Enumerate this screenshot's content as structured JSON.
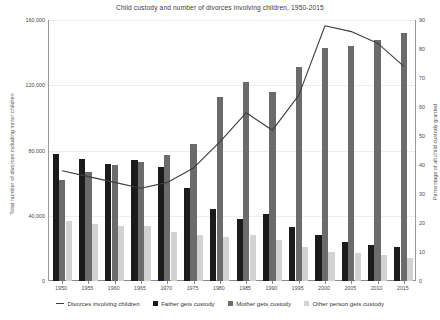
{
  "chart_data": {
    "type": "bar",
    "title": "Child custody and number of divorces involving children, 1950-2015",
    "xlabel": "",
    "ylabel": "Total number of divorces including minor children",
    "y2label": "Percentage of all child custody granted",
    "categories": [
      "1950",
      "1955",
      "1960",
      "1965",
      "1970",
      "1975",
      "1980",
      "1985",
      "1990",
      "1995",
      "2000",
      "2005",
      "2010",
      "2015"
    ],
    "ylim": [
      0,
      160000
    ],
    "yticks": [
      "0",
      "40,000",
      "80,000",
      "120,000",
      "160,000"
    ],
    "ytick_values": [
      0,
      40000,
      80000,
      120000,
      160000
    ],
    "y2lim": [
      0,
      90
    ],
    "y2ticks": [
      "0",
      "10",
      "20",
      "30",
      "40",
      "50",
      "60",
      "70",
      "80",
      "90"
    ],
    "y2tick_values": [
      0,
      10,
      20,
      30,
      40,
      50,
      60,
      70,
      80,
      90
    ],
    "grid": true,
    "legend_position": "bottom",
    "series": [
      {
        "name": "Father gets custody",
        "type": "bar",
        "axis": "left",
        "color": "#1b1b1b",
        "values": [
          78000,
          75000,
          72000,
          74000,
          70000,
          57000,
          44000,
          38000,
          41000,
          33000,
          28000,
          24000,
          22000,
          21000
        ]
      },
      {
        "name": "Mother gets custody",
        "type": "bar",
        "axis": "left",
        "color": "#6b6b6b",
        "values": [
          62000,
          67000,
          71000,
          73000,
          77000,
          84000,
          113000,
          122000,
          116000,
          131000,
          143000,
          144000,
          148000,
          152000
        ]
      },
      {
        "name": "Other person gets custody",
        "type": "bar",
        "axis": "left",
        "color": "#d2d2d2",
        "values": [
          37000,
          35000,
          34000,
          34000,
          30000,
          28000,
          27000,
          28000,
          25000,
          21000,
          18000,
          17000,
          16000,
          14000
        ]
      },
      {
        "name": "Divorces involving children",
        "type": "line",
        "axis": "right",
        "color": "#3d3d3d",
        "values": [
          38,
          36,
          34,
          32,
          34,
          39,
          48,
          58,
          52,
          64,
          88,
          86,
          82,
          74
        ]
      }
    ]
  },
  "legend": {
    "items": [
      {
        "label": "Divorces involving children",
        "marker": "line"
      },
      {
        "label": "Father gets custody",
        "marker": "father"
      },
      {
        "label": "Mother gets custody",
        "marker": "mother"
      },
      {
        "label": "Other person gets custody",
        "marker": "other"
      }
    ]
  }
}
